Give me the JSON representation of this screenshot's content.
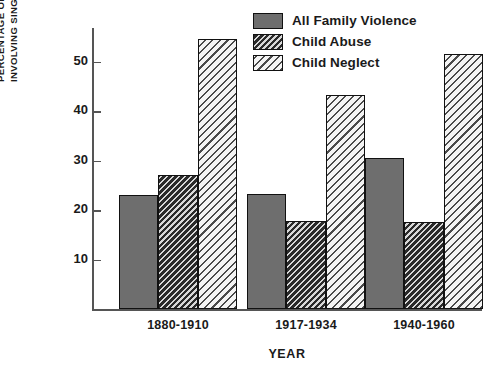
{
  "chart_data": {
    "type": "bar",
    "title": "",
    "subtitle": "",
    "xlabel": "YEAR",
    "ylabel": "PERCENTAGE OF INCIDENTS\nINVOLVING SINGLE MOTHERS",
    "categories": [
      "1880-1910",
      "1917-1934",
      "1940-1960"
    ],
    "series": [
      {
        "name": "All Family Violence",
        "swatch": "solid",
        "color": "#6e6e6e",
        "values": [
          23.1,
          23.3,
          30.5
        ]
      },
      {
        "name": "Child Abuse",
        "swatch": "dark-hatch",
        "color": "#3b3b3b",
        "values": [
          27.1,
          17.7,
          17.6
        ]
      },
      {
        "name": "Child Neglect",
        "swatch": "light-hatch",
        "color": "#efefef",
        "values": [
          54.5,
          43.2,
          51.5
        ]
      }
    ],
    "ylim": [
      0,
      57
    ],
    "yticks": [
      10,
      20,
      30,
      40,
      50
    ],
    "ytick_labels": [
      "10",
      "20",
      "30",
      "40",
      "50"
    ],
    "grid": false,
    "legend_position": "top-center"
  },
  "legend": {
    "items": [
      {
        "label": "All Family Violence"
      },
      {
        "label": "Child Abuse"
      },
      {
        "label": "Child Neglect"
      }
    ]
  }
}
